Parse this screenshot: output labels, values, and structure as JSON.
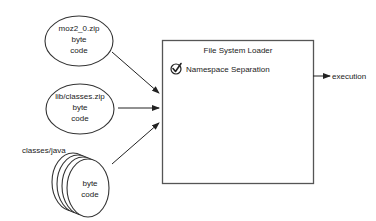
{
  "diagram": {
    "sources": [
      {
        "id": "moz2-zip",
        "lines": [
          "moz2_0.zip",
          "byte",
          "code"
        ]
      },
      {
        "id": "lib-classes-zip",
        "lines": [
          "lib/classes.zip",
          "byte",
          "code"
        ]
      },
      {
        "id": "classes-java",
        "label": "classes/java",
        "lines": [
          "byte",
          "code"
        ]
      }
    ],
    "loader": {
      "title": "File System Loader",
      "feature": "Namespace Separation",
      "feature_icon": "check-circle-icon"
    },
    "output": {
      "label": "execution"
    },
    "colors": {
      "stroke": "#333333",
      "text": "#222222",
      "box_border": "#555555",
      "background": "#ffffff"
    }
  }
}
